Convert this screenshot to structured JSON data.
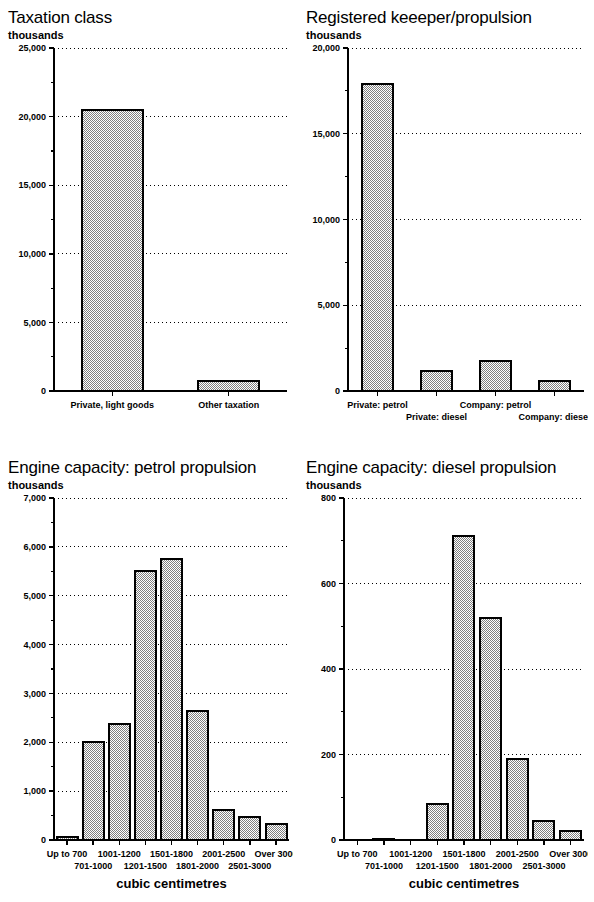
{
  "page": {
    "width": 594,
    "height": 902,
    "background": "#ffffff",
    "bar_fill_color": "#b4b4b4",
    "bar_edge_color": "#000000",
    "axis_color": "#000000",
    "grid_color": "#000000"
  },
  "panels": [
    {
      "id": "taxation-class",
      "title": "Taxation class",
      "units": "thousands",
      "axis_title": ""
    },
    {
      "id": "registered-keeper-propulsion",
      "title": "Registered keeeper/propulsion",
      "units": "thousands",
      "axis_title": ""
    },
    {
      "id": "engine-capacity-petrol",
      "title": "Engine capacity: petrol propulsion",
      "units": "thousands",
      "axis_title": "cubic centimetres"
    },
    {
      "id": "engine-capacity-diesel",
      "title": "Engine capacity: diesel propulsion",
      "units": "thousands",
      "axis_title": "cubic centimetres"
    }
  ],
  "chart_data": [
    {
      "type": "bar",
      "id": "taxation-class",
      "title": "Taxation class",
      "xlabel": "",
      "ylabel": "thousands",
      "categories": [
        "Private, light goods",
        "Other taxation"
      ],
      "values": [
        20500,
        750
      ],
      "ylim": [
        0,
        25000
      ],
      "yticks": [
        0,
        5000,
        10000,
        15000,
        20000,
        25000
      ],
      "ytick_labels": [
        "0",
        "5,000",
        "10,000",
        "15,000",
        "20,000",
        "25,000"
      ],
      "minor_ticks": [
        2500,
        7500,
        12500,
        17500,
        22500
      ],
      "grid": true,
      "grid_style": "dotted",
      "legend": "none",
      "stagger_labels": false
    },
    {
      "type": "bar",
      "id": "registered-keeper-propulsion",
      "title": "Registered keeeper/propulsion",
      "xlabel": "",
      "ylabel": "thousands",
      "categories": [
        "Private: petrol",
        "Private: diesel",
        "Company: petrol",
        "Company: diesel"
      ],
      "values": [
        17900,
        1150,
        1750,
        600
      ],
      "ylim": [
        0,
        20000
      ],
      "yticks": [
        0,
        5000,
        10000,
        15000,
        20000
      ],
      "ytick_labels": [
        "0",
        "5,000",
        "10,000",
        "15,000",
        "20,000"
      ],
      "minor_ticks": [
        2500,
        7500,
        12500,
        17500
      ],
      "grid": true,
      "grid_style": "dotted",
      "legend": "none",
      "stagger_labels": true
    },
    {
      "type": "bar",
      "id": "engine-capacity-petrol",
      "title": "Engine capacity: petrol propulsion",
      "xlabel": "cubic centimetres",
      "ylabel": "thousands",
      "categories": [
        "Up to 700",
        "701-1000",
        "1001-1200",
        "1201-1500",
        "1501-1800",
        "1801-2000",
        "2001-2500",
        "2501-3000",
        "Over 3000"
      ],
      "values": [
        70,
        2000,
        2370,
        5500,
        5760,
        2650,
        620,
        480,
        320
      ],
      "ylim": [
        0,
        7000
      ],
      "yticks": [
        0,
        1000,
        2000,
        3000,
        4000,
        5000,
        6000,
        7000
      ],
      "ytick_labels": [
        "0",
        "1,000",
        "2,000",
        "3,000",
        "4,000",
        "5,000",
        "6,000",
        "7,000"
      ],
      "minor_ticks": [
        500,
        1500,
        2500,
        3500,
        4500,
        5500,
        6500
      ],
      "grid": true,
      "grid_style": "dotted",
      "legend": "none",
      "stagger_labels": true
    },
    {
      "type": "bar",
      "id": "engine-capacity-diesel",
      "title": "Engine capacity: diesel propulsion",
      "xlabel": "cubic centimetres",
      "ylabel": "thousands",
      "categories": [
        "Up to 700",
        "701-1000",
        "1001-1200",
        "1201-1500",
        "1501-1800",
        "1801-2000",
        "2001-2500",
        "2501-3000",
        "Over 3000"
      ],
      "values": [
        0,
        3,
        0,
        85,
        710,
        520,
        190,
        45,
        22
      ],
      "ylim": [
        0,
        800
      ],
      "yticks": [
        0,
        200,
        400,
        600,
        800
      ],
      "ytick_labels": [
        "0",
        "200",
        "400",
        "600",
        "800"
      ],
      "minor_ticks": [
        100,
        300,
        500,
        700
      ],
      "grid": true,
      "grid_style": "dotted",
      "legend": "none",
      "stagger_labels": true
    }
  ]
}
